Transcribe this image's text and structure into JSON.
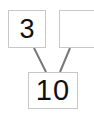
{
  "diagram": {
    "type": "number-bond",
    "part_left": "3",
    "part_right": "",
    "whole": "10",
    "line_color": "#777777",
    "box_border_color": "#c8c8c8"
  }
}
